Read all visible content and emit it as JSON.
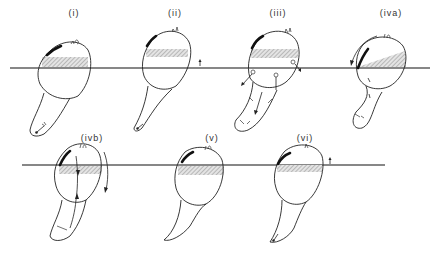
{
  "figure": {
    "panels": [
      {
        "id": "i",
        "label": "(i)",
        "row": 1,
        "label_x": 74,
        "label_y": 8
      },
      {
        "id": "ii",
        "label": "(ii)",
        "row": 1,
        "label_x": 175,
        "label_y": 8
      },
      {
        "id": "iii",
        "label": "(iii)",
        "row": 1,
        "label_x": 278,
        "label_y": 8
      },
      {
        "id": "iva",
        "label": "(iva)",
        "row": 1,
        "label_x": 391,
        "label_y": 8
      },
      {
        "id": "ivb",
        "label": "(ivb)",
        "row": 2,
        "label_x": 92,
        "label_y": 149
      },
      {
        "id": "v",
        "label": "(v)",
        "row": 2,
        "label_x": 212,
        "label_y": 149
      },
      {
        "id": "vi",
        "label": "(vi)",
        "row": 2,
        "label_x": 305,
        "label_y": 149
      }
    ],
    "waterlines": [
      {
        "row": 1,
        "y": 68,
        "x1": 10,
        "x2": 430
      },
      {
        "row": 2,
        "y": 165,
        "x1": 22,
        "x2": 385
      }
    ],
    "colors": {
      "line": "#222222",
      "hatch": "#9a9a9a",
      "background": "#ffffff"
    }
  }
}
